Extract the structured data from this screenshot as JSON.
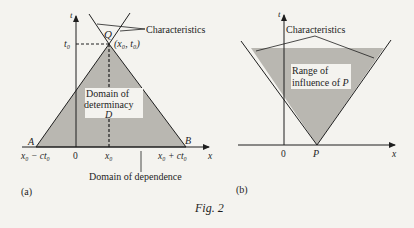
{
  "figure": {
    "caption": "Fig. 2",
    "colors": {
      "background": "#f4f3ef",
      "shade": "#b9b7b1",
      "ink": "#1e1e1e"
    }
  },
  "panel_a": {
    "tag": "(a)",
    "axes": {
      "t_label": "t",
      "x_label": "x"
    },
    "points": {
      "Q": "Q",
      "Q_coords": "(x₀, t₀)",
      "A": "A",
      "B": "B"
    },
    "ticks": {
      "t0": "t₀",
      "left_end": "x₀ − ct₀",
      "zero": "0",
      "x0": "x₀",
      "right_end": "x₀ + ct₀"
    },
    "labels": {
      "characteristics": "Characteristics",
      "domain_line1": "Domain of",
      "domain_line2": "determinacy",
      "domain_symbol": "D",
      "dependence": "Domain of dependence"
    }
  },
  "panel_b": {
    "tag": "(b)",
    "axes": {
      "t_label": "t",
      "x_label": "x"
    },
    "points": {
      "P": "P"
    },
    "ticks": {
      "zero": "0"
    },
    "labels": {
      "characteristics": "Characteristics",
      "range_line1": "Range of",
      "range_line2": "influence of",
      "range_symbol": "P"
    }
  }
}
